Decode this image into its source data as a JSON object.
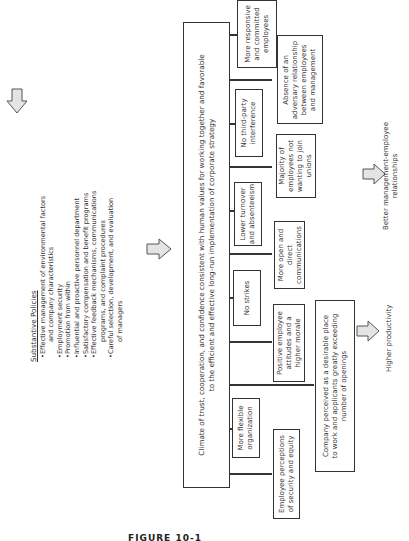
{
  "arrows": {
    "top": "down-arrow",
    "middle": "right-arrow",
    "productivity": "right-arrow",
    "relationships": "right-arrow"
  },
  "policies": {
    "heading": "Substantive Policies",
    "items": [
      {
        "line1": "•Effective management of environmental factors",
        "line2": "and company characteristics"
      },
      {
        "line1": "•Employment security"
      },
      {
        "line1": "•Promotion from within"
      },
      {
        "line1": "•Influential and proactive personnel department"
      },
      {
        "line1": "•Satisfactory compensation and benefit programs"
      },
      {
        "line1": "•Effective feedback mechanisms, communications",
        "line2": "programs, and complaint procedures"
      },
      {
        "line1": "•Careful selection, development, and evaluation",
        "line2": "of managers"
      }
    ]
  },
  "climate": {
    "line1": "Climate of trust, cooperation, and confidence consistent with human values for working together and favorable",
    "line2": "to the efficient and effective long-run implementation of corporate strategy"
  },
  "outcomes": [
    {
      "line1": "Employee perceptions",
      "line2": "of security and equity"
    },
    {
      "line1": "More flexible",
      "line2": "organization"
    },
    {
      "line1": "Company perceived as a desirable place",
      "line2": "to work and applicants greatly exceeding",
      "line3": "number of openings"
    },
    {
      "line1": "Positive employee",
      "line2": "attitudes and a",
      "line3": "higher morale"
    },
    {
      "line1": "No strikes"
    },
    {
      "line1": "More open and",
      "line2": "direct",
      "line3": "communications"
    },
    {
      "line1": "Lower turnover",
      "line2": "and absenteeism"
    },
    {
      "line1": "Majority of",
      "line2": "employees not",
      "line3": "wanting to join",
      "line4": "unions"
    },
    {
      "line1": "No third-party",
      "line2": "interference"
    },
    {
      "line1": "Absence of an",
      "line2": "adversary relationship",
      "line3": "between employees",
      "line4": "and management"
    },
    {
      "line1": "More responsive",
      "line2": "and committed",
      "line3": "employees"
    }
  ],
  "results": {
    "productivity": "Higher productivity",
    "relationships_line1": "Better management-employee",
    "relationships_line2": "relationships"
  },
  "figure_label": "FIGURE 10-1"
}
